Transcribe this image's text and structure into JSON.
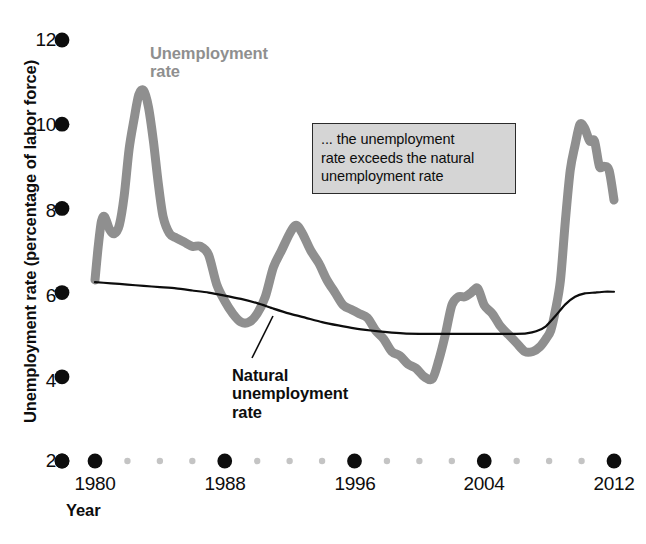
{
  "chart_data": {
    "type": "line",
    "title": "",
    "xlabel": "Year",
    "ylabel": "Unemployment rate (percentage of labor force)",
    "xlim": [
      1979,
      2012.5
    ],
    "ylim": [
      2,
      12
    ],
    "grid": false,
    "legend_position": "inline-labels",
    "xticks": [
      1980,
      1988,
      1996,
      2004,
      2012
    ],
    "xtick_labels": [
      "1980",
      "1988",
      "1996",
      "2004",
      "2012"
    ],
    "yticks": [
      2,
      4,
      6,
      8,
      10,
      12
    ],
    "ytick_labels": [
      "2",
      "4",
      "6",
      "8",
      "10",
      "12"
    ],
    "axis_style": "dotted-markers",
    "minor_x_step_years": 2,
    "series": [
      {
        "name": "Unemployment rate",
        "color": "#8f8f8f",
        "linewidth": 9,
        "x": [
          1980.0,
          1980.2,
          1980.4,
          1980.6,
          1980.9,
          1981.2,
          1981.5,
          1981.8,
          1982.1,
          1982.4,
          1982.7,
          1983.0,
          1983.3,
          1983.6,
          1983.9,
          1984.2,
          1984.6,
          1985.0,
          1985.5,
          1986.0,
          1986.5,
          1987.0,
          1987.5,
          1988.0,
          1988.5,
          1989.0,
          1989.5,
          1990.0,
          1990.5,
          1991.0,
          1991.5,
          1992.0,
          1992.4,
          1992.8,
          1993.3,
          1993.8,
          1994.3,
          1994.8,
          1995.3,
          1995.8,
          1996.3,
          1996.8,
          1997.3,
          1997.8,
          1998.3,
          1998.8,
          1999.3,
          1999.8,
          2000.3,
          2000.8,
          2001.2,
          2001.6,
          2002.0,
          2002.4,
          2002.8,
          2003.2,
          2003.6,
          2004.0,
          2004.5,
          2005.0,
          2005.5,
          2006.0,
          2006.5,
          2007.0,
          2007.4,
          2007.8,
          2008.1,
          2008.4,
          2008.7,
          2009.0,
          2009.3,
          2009.6,
          2009.9,
          2010.2,
          2010.5,
          2010.8,
          2011.1,
          2011.4,
          2011.7,
          2012.0
        ],
        "y": [
          6.3,
          7.1,
          7.7,
          7.8,
          7.5,
          7.4,
          7.6,
          8.3,
          9.4,
          10.1,
          10.7,
          10.8,
          10.4,
          9.6,
          8.6,
          7.8,
          7.4,
          7.3,
          7.2,
          7.1,
          7.1,
          6.9,
          6.2,
          5.8,
          5.5,
          5.3,
          5.3,
          5.5,
          5.9,
          6.6,
          7.0,
          7.4,
          7.6,
          7.4,
          7.0,
          6.7,
          6.3,
          6.0,
          5.7,
          5.6,
          5.5,
          5.4,
          5.1,
          4.9,
          4.6,
          4.5,
          4.3,
          4.2,
          4.0,
          3.95,
          4.4,
          5.0,
          5.7,
          5.9,
          5.9,
          6.0,
          6.1,
          5.7,
          5.5,
          5.2,
          5.0,
          4.8,
          4.6,
          4.6,
          4.7,
          4.9,
          5.1,
          5.6,
          6.3,
          7.7,
          8.9,
          9.5,
          10.0,
          9.9,
          9.6,
          9.6,
          9.0,
          9.0,
          8.9,
          8.2
        ]
      },
      {
        "name": "Natural unemployment rate",
        "color": "#0d0d0d",
        "linewidth": 2.2,
        "x": [
          1980.0,
          1981.0,
          1982.0,
          1983.0,
          1984.0,
          1985.0,
          1986.0,
          1987.0,
          1988.0,
          1989.0,
          1990.0,
          1991.0,
          1992.0,
          1993.0,
          1994.0,
          1995.0,
          1996.0,
          1997.0,
          1998.0,
          1999.0,
          2000.0,
          2001.0,
          2002.0,
          2003.0,
          2004.0,
          2005.0,
          2006.0,
          2006.6,
          2007.2,
          2007.8,
          2008.4,
          2009.0,
          2009.6,
          2010.2,
          2010.8,
          2011.4,
          2012.0
        ],
        "y": [
          6.25,
          6.22,
          6.19,
          6.16,
          6.13,
          6.1,
          6.05,
          6.0,
          5.93,
          5.85,
          5.75,
          5.62,
          5.5,
          5.4,
          5.3,
          5.22,
          5.15,
          5.1,
          5.06,
          5.03,
          5.02,
          5.02,
          5.02,
          5.02,
          5.02,
          5.02,
          5.02,
          5.03,
          5.08,
          5.2,
          5.45,
          5.72,
          5.9,
          5.98,
          6.0,
          6.02,
          6.02
        ]
      }
    ],
    "annotations": [
      {
        "name": "callout-box",
        "text": "... the unemployment rate exceeds the natural unemployment rate",
        "background": "#d5d5d5",
        "border_color": "#2b2b2b"
      },
      {
        "name": "unemployment-rate-label",
        "text": "Unemployment\nrate",
        "color": "#8f8f8f"
      },
      {
        "name": "natural-unemployment-rate-label",
        "text": "Natural\nunemployment\nrate",
        "color": "#0d0d0d",
        "has_leader_line": true
      }
    ]
  },
  "axis": {
    "y_title": "Unemployment rate (percentage of labor force)",
    "x_title": "Year",
    "y_ticks": [
      "12",
      "10",
      "8",
      "6",
      "4",
      "2"
    ],
    "x_ticks": [
      "1980",
      "1988",
      "1996",
      "2004",
      "2012"
    ]
  },
  "labels": {
    "unemployment_line1": "Unemployment",
    "unemployment_line2": "rate",
    "natural_line1": "Natural",
    "natural_line2": "unemployment",
    "natural_line3": "rate",
    "callout_line1": "... the unemployment",
    "callout_line2": "rate exceeds the natural",
    "callout_line3": "unemployment rate"
  },
  "colors": {
    "unemployment": "#8f8f8f",
    "natural": "#0d0d0d",
    "callout_bg": "#d5d5d5",
    "callout_border": "#2b2b2b",
    "minor_tick": "#c4c4c4"
  }
}
